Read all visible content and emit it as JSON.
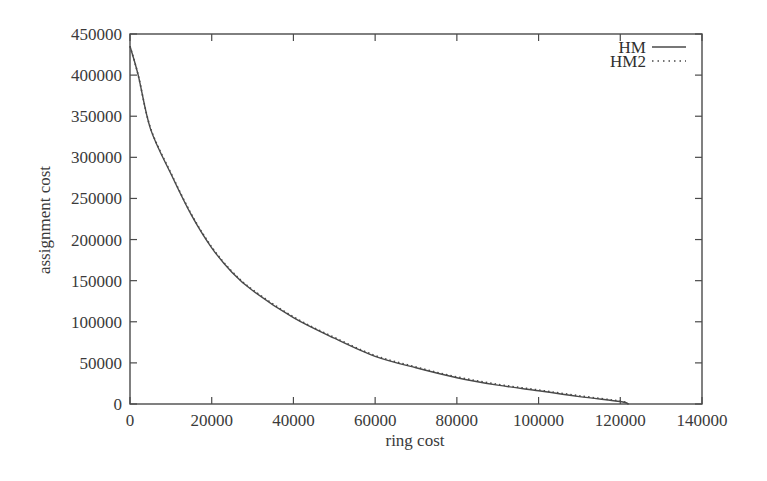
{
  "chart_data": {
    "type": "line",
    "title": "",
    "xlabel": "ring cost",
    "ylabel": "assignment cost",
    "xlim": [
      0,
      140000
    ],
    "ylim": [
      0,
      450000
    ],
    "xticks": [
      0,
      20000,
      40000,
      60000,
      80000,
      100000,
      120000,
      140000
    ],
    "yticks": [
      0,
      50000,
      100000,
      150000,
      200000,
      250000,
      300000,
      350000,
      400000,
      450000
    ],
    "xtick_labels": [
      "0",
      "20000",
      "40000",
      "60000",
      "80000",
      "100000",
      "120000",
      "140000"
    ],
    "ytick_labels": [
      "0",
      "50000",
      "100000",
      "150000",
      "200000",
      "250000",
      "300000",
      "350000",
      "400000",
      "450000"
    ],
    "grid": false,
    "legend_position": "top-right",
    "series": [
      {
        "name": "HM",
        "style": "solid",
        "x": [
          0,
          2000,
          5000,
          10000,
          15000,
          20000,
          25000,
          30000,
          40000,
          50000,
          60000,
          70000,
          80000,
          90000,
          100000,
          110000,
          120000,
          122000
        ],
        "values": [
          435000,
          400000,
          335000,
          280000,
          230000,
          190000,
          160000,
          138000,
          105000,
          80000,
          58000,
          44000,
          32000,
          23000,
          16000,
          9000,
          3000,
          0
        ]
      },
      {
        "name": "HM2",
        "style": "dotted",
        "x": [
          0,
          2000,
          5000,
          10000,
          15000,
          20000,
          25000,
          30000,
          40000,
          50000,
          60000,
          70000,
          80000,
          90000,
          100000,
          110000,
          120000,
          122000
        ],
        "values": [
          435000,
          400000,
          336000,
          281000,
          231000,
          191000,
          161000,
          139000,
          106000,
          81000,
          59000,
          45000,
          33000,
          24000,
          17000,
          10000,
          3500,
          0
        ]
      }
    ]
  },
  "colors": {
    "axis": "#4a4a4a",
    "line": "#4a4a4a",
    "text": "#3a3a3a",
    "background": "#ffffff"
  }
}
